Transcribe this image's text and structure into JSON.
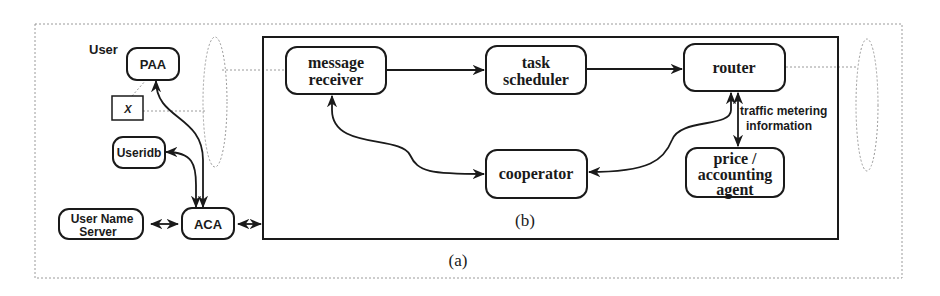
{
  "figure": {
    "outer_caption": "(a)",
    "inner_caption": "(b)"
  },
  "left_cluster": {
    "user_label": "User",
    "nodes": {
      "paa": "PAA",
      "x_box": "X",
      "useridb": "Useridb",
      "user_name_server": [
        "User Name",
        "Server"
      ],
      "aca": "ACA"
    }
  },
  "inner_box": {
    "nodes": {
      "message_receiver": [
        "message",
        "receiver"
      ],
      "task_scheduler": [
        "task",
        "scheduler"
      ],
      "router": "router",
      "cooperator": "cooperator",
      "price_accounting_agent": [
        "price /",
        "accounting",
        "agent"
      ]
    },
    "edge_labels": {
      "router_to_price": [
        "traffic metering",
        "information"
      ]
    }
  },
  "colors": {
    "stroke": "#1a1a1a",
    "dotted": "#9a9a9a",
    "background": "#ffffff"
  }
}
